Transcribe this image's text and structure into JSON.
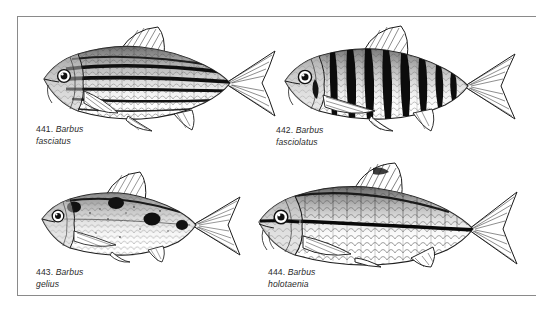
{
  "plate": {
    "background_color": "#ffffff",
    "border_color": "#8a8a8a",
    "ink_color": "#1a1a1a"
  },
  "figures": [
    {
      "id": "fig-441",
      "number": "441.",
      "genus": "Barbus",
      "species": "fasciatus",
      "pattern": "horizontal-stripes",
      "caption_full": "441. Barbus fasciatus"
    },
    {
      "id": "fig-442",
      "number": "442.",
      "genus": "Barbus",
      "species": "fasciolatus",
      "pattern": "vertical-bars",
      "caption_full": "442. Barbus fasciolatus"
    },
    {
      "id": "fig-443",
      "number": "443.",
      "genus": "Barbus",
      "species": "gelius",
      "pattern": "dark-blotches",
      "caption_full": "443. Barbus gelius"
    },
    {
      "id": "fig-444",
      "number": "444.",
      "genus": "Barbus",
      "species": "holotaenia",
      "pattern": "single-lateral-stripe",
      "caption_full": "444. Barbus holotaenia"
    }
  ]
}
